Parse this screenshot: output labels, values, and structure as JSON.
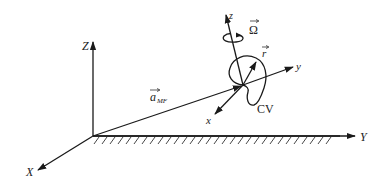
{
  "diagram": {
    "type": "coordinate-frame-schematic",
    "inertial_frame": {
      "axes": [
        {
          "name": "Z",
          "label": "Z"
        },
        {
          "name": "Y",
          "label": "Y"
        },
        {
          "name": "X",
          "label": "X"
        }
      ],
      "ground": "hatched surface along Y axis"
    },
    "relative_frame": {
      "axes": [
        {
          "name": "z",
          "label": "z"
        },
        {
          "name": "y",
          "label": "y"
        },
        {
          "name": "x",
          "label": "x"
        }
      ]
    },
    "vectors": {
      "a_MF": {
        "symbol": "a",
        "subscript": "MF"
      },
      "r": {
        "symbol": "r"
      },
      "omega": {
        "symbol": "Ω"
      }
    },
    "control_volume": {
      "label": "CV"
    }
  }
}
